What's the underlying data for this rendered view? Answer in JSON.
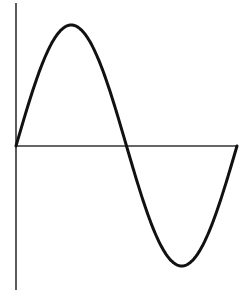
{
  "diagram": {
    "type": "sine-wave",
    "colors": {
      "background": "#ffffff",
      "axis": "#333333",
      "curve": "#111111"
    },
    "axes": {
      "vertical": {
        "x": 16,
        "y_top": 3,
        "y_bottom": 290
      },
      "horizontal": {
        "y": 146,
        "x_start": 16,
        "x_end": 237
      }
    },
    "curve": {
      "start": [
        16,
        146
      ],
      "peak": [
        72,
        25
      ],
      "zero_crossing": [
        127,
        146
      ],
      "trough": [
        182,
        266
      ],
      "end": [
        237,
        146
      ],
      "periods": 1
    }
  }
}
